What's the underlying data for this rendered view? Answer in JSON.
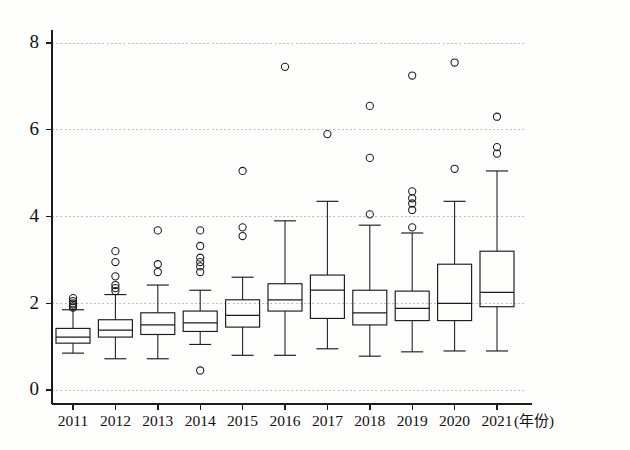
{
  "chart_data": {
    "type": "box",
    "title": "",
    "subtitle": "",
    "xlabel": "(年份)",
    "ylabel": "",
    "grid": true,
    "legend": null,
    "xlim": [
      2010.5,
      2021.5
    ],
    "ylim": [
      0,
      8.6
    ],
    "y_ticks": [
      0,
      2,
      4,
      6,
      8
    ],
    "y_tick_labels": [
      "0",
      "2",
      "4",
      "6",
      "8"
    ],
    "categories": [
      "2011",
      "2012",
      "2013",
      "2014",
      "2015",
      "2016",
      "2017",
      "2018",
      "2019",
      "2020",
      "2021"
    ],
    "boxes": [
      {
        "category": "2011",
        "whisker_low": 0.85,
        "q1": 1.08,
        "median": 1.22,
        "q3": 1.42,
        "whisker_high": 1.85,
        "outliers": [
          1.9,
          1.93,
          1.97,
          2.0,
          2.05,
          2.12
        ]
      },
      {
        "category": "2012",
        "whisker_low": 0.72,
        "q1": 1.22,
        "median": 1.38,
        "q3": 1.62,
        "whisker_high": 2.2,
        "outliers": [
          2.28,
          2.35,
          2.42,
          2.62,
          2.95,
          3.2
        ]
      },
      {
        "category": "2013",
        "whisker_low": 0.72,
        "q1": 1.28,
        "median": 1.5,
        "q3": 1.78,
        "whisker_high": 2.42,
        "outliers": [
          2.72,
          2.9,
          3.68
        ]
      },
      {
        "category": "2014",
        "whisker_low": 1.05,
        "q1": 1.35,
        "median": 1.55,
        "q3": 1.82,
        "whisker_high": 2.3,
        "outliers": [
          0.45,
          2.72,
          2.85,
          2.95,
          3.05,
          3.32,
          3.68
        ]
      },
      {
        "category": "2015",
        "whisker_low": 0.8,
        "q1": 1.45,
        "median": 1.72,
        "q3": 2.08,
        "whisker_high": 2.6,
        "outliers": [
          3.55,
          3.75,
          5.05
        ]
      },
      {
        "category": "2016",
        "whisker_low": 0.8,
        "q1": 1.82,
        "median": 2.08,
        "q3": 2.45,
        "whisker_high": 3.9,
        "outliers": [
          7.45
        ]
      },
      {
        "category": "2017",
        "whisker_low": 0.95,
        "q1": 1.65,
        "median": 2.3,
        "q3": 2.65,
        "whisker_high": 4.35,
        "outliers": [
          5.9
        ]
      },
      {
        "category": "2018",
        "whisker_low": 0.78,
        "q1": 1.5,
        "median": 1.78,
        "q3": 2.3,
        "whisker_high": 3.8,
        "outliers": [
          4.05,
          5.35,
          6.55
        ]
      },
      {
        "category": "2019",
        "whisker_low": 0.88,
        "q1": 1.6,
        "median": 1.88,
        "q3": 2.28,
        "whisker_high": 3.62,
        "outliers": [
          3.75,
          4.15,
          4.3,
          4.42,
          4.58,
          7.25
        ]
      },
      {
        "category": "2020",
        "whisker_low": 0.9,
        "q1": 1.6,
        "median": 2.0,
        "q3": 2.9,
        "whisker_high": 4.35,
        "outliers": [
          5.1,
          7.55
        ]
      },
      {
        "category": "2021",
        "whisker_low": 0.9,
        "q1": 1.92,
        "median": 2.25,
        "q3": 3.2,
        "whisker_high": 5.05,
        "outliers": [
          5.45,
          5.6,
          6.3
        ]
      }
    ]
  },
  "axes": {
    "x_axis_unit": "(年份)"
  },
  "colors": {
    "line": "#1b1b1b",
    "grid": "#b9b9b9",
    "background": "#fdfdfc"
  }
}
